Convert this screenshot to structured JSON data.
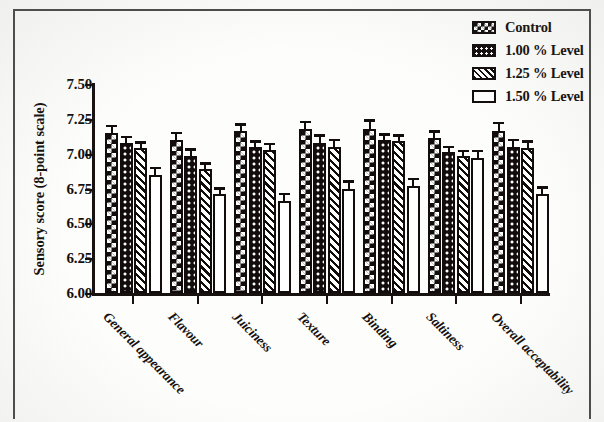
{
  "chart_data": {
    "type": "bar",
    "title": "",
    "xlabel": "",
    "ylabel": "Sensory score (8-point scale)",
    "ylim": [
      6.0,
      7.5
    ],
    "yticks": [
      "6.00",
      "6.25",
      "6.50",
      "6.75",
      "7.00",
      "7.25",
      "7.50"
    ],
    "ytick_values": [
      6.0,
      6.25,
      6.5,
      6.75,
      7.0,
      7.25,
      7.5
    ],
    "grid": false,
    "legend_position": "top-right",
    "error_bars": "standard error",
    "categories": [
      "General appearance",
      "Flavour",
      "Juiciness",
      "Texture",
      "Binding",
      "Saltiness",
      "Overall acceptability"
    ],
    "series": [
      {
        "name": "Control",
        "pattern": "diamond-lattice",
        "values": [
          7.15,
          7.1,
          7.16,
          7.18,
          7.18,
          7.11,
          7.16
        ],
        "errors": [
          0.04,
          0.04,
          0.04,
          0.04,
          0.05,
          0.04,
          0.05
        ]
      },
      {
        "name": "1.00 % Level",
        "pattern": "white-dots",
        "values": [
          7.08,
          6.98,
          7.05,
          7.08,
          7.1,
          7.01,
          7.05
        ],
        "errors": [
          0.03,
          0.04,
          0.03,
          0.04,
          0.03,
          0.03,
          0.04
        ]
      },
      {
        "name": "1.25 % Level",
        "pattern": "diagonal-hatch",
        "values": [
          7.04,
          6.89,
          7.03,
          7.05,
          7.09,
          6.98,
          7.04
        ],
        "errors": [
          0.03,
          0.03,
          0.03,
          0.04,
          0.03,
          0.03,
          0.04
        ]
      },
      {
        "name": "1.50 % Level",
        "pattern": "open-white",
        "values": [
          6.85,
          6.71,
          6.66,
          6.75,
          6.77,
          6.97,
          6.71
        ],
        "errors": [
          0.04,
          0.03,
          0.04,
          0.04,
          0.04,
          0.04,
          0.04
        ]
      }
    ]
  },
  "legend": {
    "items": [
      {
        "label": "Control"
      },
      {
        "label": "1.00 % Level"
      },
      {
        "label": "1.25 % Level"
      },
      {
        "label": "1.50 % Level"
      }
    ]
  },
  "colors": {
    "ink": "#120d0c",
    "paper": "#fdfdfb",
    "frame": "#4a4a48"
  }
}
